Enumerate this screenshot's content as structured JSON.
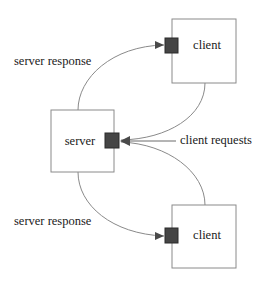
{
  "diagram": {
    "background_color": "#ffffff",
    "line_color": "#8a8a8a",
    "port_color": "#454545",
    "text_color": "#1a1a1a",
    "nodes": [
      {
        "id": "client-top",
        "label": "client",
        "x": 172,
        "y": 19,
        "width": 64,
        "height": 64,
        "label_x": 207,
        "label_y": 46
      },
      {
        "id": "server",
        "label": "server",
        "x": 51,
        "y": 110,
        "width": 63,
        "height": 62,
        "label_x": 80,
        "label_y": 142
      },
      {
        "id": "client-bottom",
        "label": "client",
        "x": 172,
        "y": 205,
        "width": 64,
        "height": 63,
        "label_x": 207,
        "label_y": 236
      }
    ],
    "ports": [
      {
        "id": "port-client-top",
        "x": 165,
        "y": 38,
        "width": 13,
        "height": 15
      },
      {
        "id": "port-server",
        "x": 105,
        "y": 133,
        "width": 14,
        "height": 15
      },
      {
        "id": "port-client-bottom",
        "x": 165,
        "y": 228,
        "width": 13,
        "height": 15
      }
    ],
    "edges": [
      {
        "id": "server-response-top",
        "label": "server response",
        "label_x": 14,
        "label_y": 62,
        "direction": "server-to-client",
        "path": "M 78 110 C 78 78 112 46 164 45"
      },
      {
        "id": "client-requests-top",
        "label": "",
        "direction": "client-to-server",
        "path": "M 205 83 C 205 116 168 139 121 140"
      },
      {
        "id": "client-requests-bottom",
        "label": "client requests",
        "label_x": 180,
        "label_y": 141,
        "direction": "client-to-server",
        "path": "M 205 205 C 205 172 168 144 121 142"
      },
      {
        "id": "server-response-bottom",
        "label": "server response",
        "label_x": 14,
        "label_y": 222,
        "direction": "server-to-client",
        "path": "M 78 172 C 78 205 112 234 164 236"
      }
    ],
    "leader": {
      "id": "client-requests-leader",
      "path": "M 176 141 L 122 141"
    },
    "arrowheads": [
      {
        "id": "arrow-client-top",
        "points": "164,45 155,41 155,49",
        "rotation": 0
      },
      {
        "id": "arrow-server-in",
        "points": "120,141 130,136 130,146",
        "rotation": 180
      },
      {
        "id": "arrow-client-bottom",
        "points": "164,236 155,232 155,240",
        "rotation": 0
      }
    ]
  }
}
